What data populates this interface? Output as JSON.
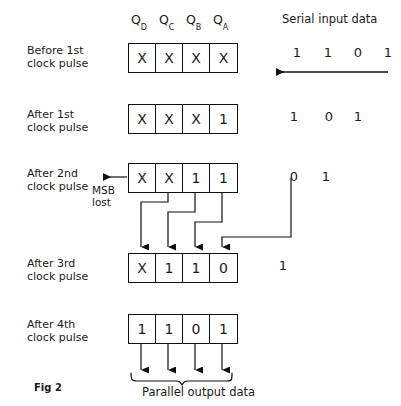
{
  "figure": {
    "caption": "Fig 2",
    "title_serial": "Serial  input  data",
    "title_parallel": "Parallel output data",
    "msb_label": "MSB\nlost",
    "column_headers": [
      {
        "base": "Q",
        "sub": "D"
      },
      {
        "base": "Q",
        "sub": "C"
      },
      {
        "base": "Q",
        "sub": "B"
      },
      {
        "base": "Q",
        "sub": "A"
      }
    ],
    "rows": [
      {
        "caption": "Before  1st\nclock pulse",
        "cells": [
          "X",
          "X",
          "X",
          "X"
        ],
        "serial_remaining": [
          "1",
          "1",
          "0",
          "1"
        ]
      },
      {
        "caption": "After 1st\nclock pulse",
        "cells": [
          "X",
          "X",
          "X",
          "1"
        ],
        "serial_remaining": [
          "1",
          "0",
          "1"
        ]
      },
      {
        "caption": "After  2nd\nclock pulse",
        "cells": [
          "X",
          "X",
          "1",
          "1"
        ],
        "serial_remaining": [
          "0",
          "1"
        ]
      },
      {
        "caption": "After  3rd\nclock pulse",
        "cells": [
          "X",
          "1",
          "1",
          "0"
        ],
        "serial_remaining": [
          "1"
        ]
      },
      {
        "caption": "After 4th\nclock pulse",
        "cells": [
          "1",
          "1",
          "0",
          "1"
        ],
        "serial_remaining": []
      }
    ],
    "colors": {
      "ink": "#101010",
      "background": "#ffffff"
    }
  }
}
